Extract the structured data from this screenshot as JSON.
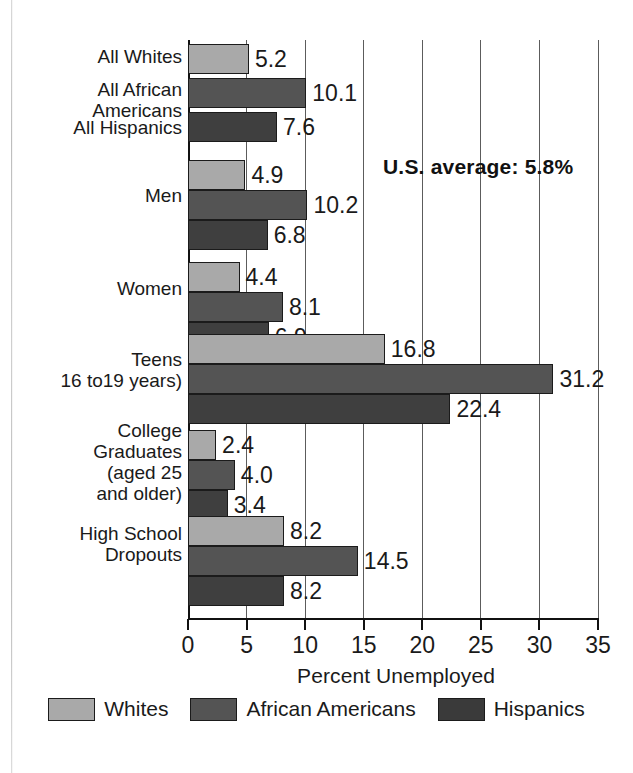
{
  "chart_data": {
    "type": "bar",
    "orientation": "horizontal",
    "title": "",
    "xlabel": "Percent Unemployed",
    "ylabel": "",
    "xlim": [
      0,
      35
    ],
    "xticks": [
      0,
      5,
      10,
      15,
      20,
      25,
      30,
      35
    ],
    "grid": true,
    "grid_axis": "x",
    "legend_position": "bottom",
    "categories": [
      "All Whites",
      "All African\nAmericans",
      "All Hispanics",
      "Men",
      "Women",
      "Teens\n16 to19 years)",
      "College\nGraduates\n(aged 25\nand older)",
      "High School\nDropouts"
    ],
    "series": [
      {
        "name": "Whites",
        "color": "#a9a9a9"
      },
      {
        "name": "African Americans",
        "color": "#545454"
      },
      {
        "name": "Hispanics",
        "color": "#3f3f3f"
      }
    ],
    "groups": [
      {
        "label": "All Whites",
        "label_lines": [
          "All Whites"
        ],
        "bars": [
          {
            "series": "Whites",
            "value": 5.2
          }
        ]
      },
      {
        "label": "All African Americans",
        "label_lines": [
          "All African",
          "Americans"
        ],
        "bars": [
          {
            "series": "African Americans",
            "value": 10.1
          }
        ]
      },
      {
        "label": "All Hispanics",
        "label_lines": [
          "All Hispanics"
        ],
        "bars": [
          {
            "series": "Hispanics",
            "value": 7.6
          }
        ]
      },
      {
        "label": "Men",
        "label_lines": [
          "Men"
        ],
        "bars": [
          {
            "series": "Whites",
            "value": 4.9
          },
          {
            "series": "African Americans",
            "value": 10.2
          },
          {
            "series": "Hispanics",
            "value": 6.8
          }
        ]
      },
      {
        "label": "Women",
        "label_lines": [
          "Women"
        ],
        "bars": [
          {
            "series": "Whites",
            "value": 4.4
          },
          {
            "series": "African Americans",
            "value": 8.1
          },
          {
            "series": "Hispanics",
            "value": 6.9
          }
        ]
      },
      {
        "label": "Teens",
        "label_lines": [
          "Teens",
          "16 to19 years)"
        ],
        "bars": [
          {
            "series": "Whites",
            "value": 16.8
          },
          {
            "series": "African Americans",
            "value": 31.2
          },
          {
            "series": "Hispanics",
            "value": 22.4
          }
        ]
      },
      {
        "label": "College Graduates",
        "label_lines": [
          "College",
          "Graduates",
          "(aged 25",
          "and older)"
        ],
        "bars": [
          {
            "series": "Whites",
            "value": 2.4
          },
          {
            "series": "African Americans",
            "value": 4.0
          },
          {
            "series": "Hispanics",
            "value": 3.4
          }
        ]
      },
      {
        "label": "High School Dropouts",
        "label_lines": [
          "High School",
          "Dropouts"
        ],
        "bars": [
          {
            "series": "Whites",
            "value": 8.2
          },
          {
            "series": "African Americans",
            "value": 14.5
          },
          {
            "series": "Hispanics",
            "value": 8.2
          }
        ]
      }
    ],
    "annotations": [
      {
        "text": "U.S. average: 5.8%",
        "value": 5.8,
        "bold": true
      }
    ]
  },
  "axis": {
    "tick_labels": [
      "0",
      "5",
      "10",
      "15",
      "20",
      "25",
      "30",
      "35"
    ],
    "title": "Percent Unemployed"
  },
  "bar_labels": {
    "all_whites": "5.2",
    "all_african_americans": "10.1",
    "all_hispanics": "7.6",
    "men_whites": "4.9",
    "men_african": "10.2",
    "men_hispanic": "6.8",
    "women_whites": "4.4",
    "women_african": "8.1",
    "women_hispanic": "6.9",
    "teens_whites": "16.8",
    "teens_african": "31.2",
    "teens_hispanic": "22.4",
    "college_whites": "2.4",
    "college_african": "4.0",
    "college_hispanic": "3.4",
    "dropouts_whites": "8.2",
    "dropouts_african": "14.5",
    "dropouts_hispanic": "8.2"
  },
  "category_labels": {
    "all_whites": "All Whites",
    "all_african_americans": "All African\nAmericans",
    "all_hispanics": "All Hispanics",
    "men": "Men",
    "women": "Women",
    "teens": "Teens\n16 to19 years)",
    "college": "College\nGraduates\n(aged 25\nand older)",
    "dropouts": "High School\nDropouts"
  },
  "annotation": {
    "us_average": "U.S. average: 5.8%"
  },
  "legend": {
    "items": [
      {
        "label": "Whites",
        "color": "#a9a9a9"
      },
      {
        "label": "African Americans",
        "color": "#545454"
      },
      {
        "label": "Hispanics",
        "color": "#3a3a3a"
      }
    ]
  }
}
